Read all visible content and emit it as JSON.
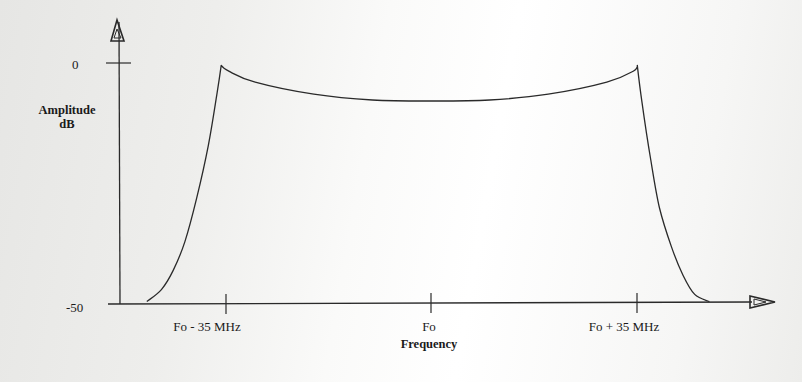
{
  "chart_data": {
    "type": "line",
    "title": "",
    "xlabel": "Frequency",
    "ylabel": "Amplitude dB",
    "ylabel_lines": [
      "Amplitude",
      "dB"
    ],
    "x_unit": "MHz offset from Fo",
    "y_ticks": [
      {
        "value": 0,
        "label": "0"
      },
      {
        "value": -50,
        "label": "-50"
      }
    ],
    "x_ticks": [
      {
        "value": -35,
        "label": "Fo - 35 MHz"
      },
      {
        "value": 0,
        "label": "Fo"
      },
      {
        "value": 35,
        "label": "Fo + 35 MHz"
      }
    ],
    "ylim": [
      -50,
      0
    ],
    "xlim": [
      -53,
      63
    ],
    "grid": false,
    "legend": null,
    "series": [
      {
        "name": "Spectrum",
        "x": [
          -48.5,
          -46,
          -44,
          -42,
          -40,
          -38,
          -36.5,
          -35.8,
          -34.5,
          -30,
          -20,
          -10,
          0,
          10,
          20,
          30,
          34.5,
          35.2,
          36,
          37.5,
          39,
          41,
          43,
          45,
          47.5
        ],
        "y": [
          -49.5,
          -47,
          -43,
          -37,
          -28,
          -17,
          -6,
          -0.3,
          -1.5,
          -3.8,
          -6.3,
          -7.5,
          -7.7,
          -7.5,
          -6.3,
          -3.8,
          -1.5,
          -0.3,
          -8,
          -20,
          -30,
          -38,
          -44,
          -48,
          -49.5
        ]
      }
    ]
  },
  "labels": {
    "y_tick_0": "0",
    "y_tick_neg50": "-50",
    "y_title_line1": "Amplitude",
    "y_title_line2": "dB",
    "x_tick_left": "Fo - 35 MHz",
    "x_tick_center": "Fo",
    "x_tick_right": "Fo + 35 MHz",
    "x_title": "Frequency"
  },
  "colors": {
    "line": "#2a2a2a",
    "axis": "#2a2a2a"
  }
}
